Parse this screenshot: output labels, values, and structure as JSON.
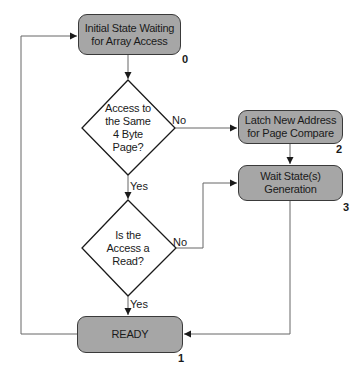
{
  "diagram": {
    "type": "state-flowchart",
    "colors": {
      "state_fill": "#a6a6a6",
      "state_border": "#3a3a3a",
      "line": "#555555",
      "decision_border": "#1a1a1a",
      "background": "#ffffff"
    },
    "states": [
      {
        "id": "0",
        "number": "0",
        "line1": "Initial State Waiting",
        "line2": "for Array Access"
      },
      {
        "id": "2",
        "number": "2",
        "line1": "Latch New Address",
        "line2": "for Page Compare"
      },
      {
        "id": "3",
        "number": "3",
        "line1": "Wait State(s)",
        "line2": "Generation"
      },
      {
        "id": "1",
        "number": "1",
        "line1": "READY",
        "line2": ""
      }
    ],
    "decisions": [
      {
        "id": "same-page",
        "lines": [
          "Access to",
          "the Same",
          "4 Byte",
          "Page?"
        ]
      },
      {
        "id": "is-read",
        "lines": [
          "Is the",
          "Access a",
          "Read?"
        ]
      }
    ],
    "edges": [
      {
        "from": "0",
        "to": "same-page",
        "label": ""
      },
      {
        "from": "same-page",
        "to": "2",
        "label": "No"
      },
      {
        "from": "same-page",
        "to": "is-read",
        "label": "Yes"
      },
      {
        "from": "2",
        "to": "3",
        "label": ""
      },
      {
        "from": "is-read",
        "to": "3",
        "label": "No"
      },
      {
        "from": "is-read",
        "to": "1",
        "label": "Yes"
      },
      {
        "from": "3",
        "to": "1",
        "label": ""
      },
      {
        "from": "1",
        "to": "0",
        "label": ""
      }
    ],
    "labels": {
      "no": "No",
      "yes": "Yes"
    }
  }
}
